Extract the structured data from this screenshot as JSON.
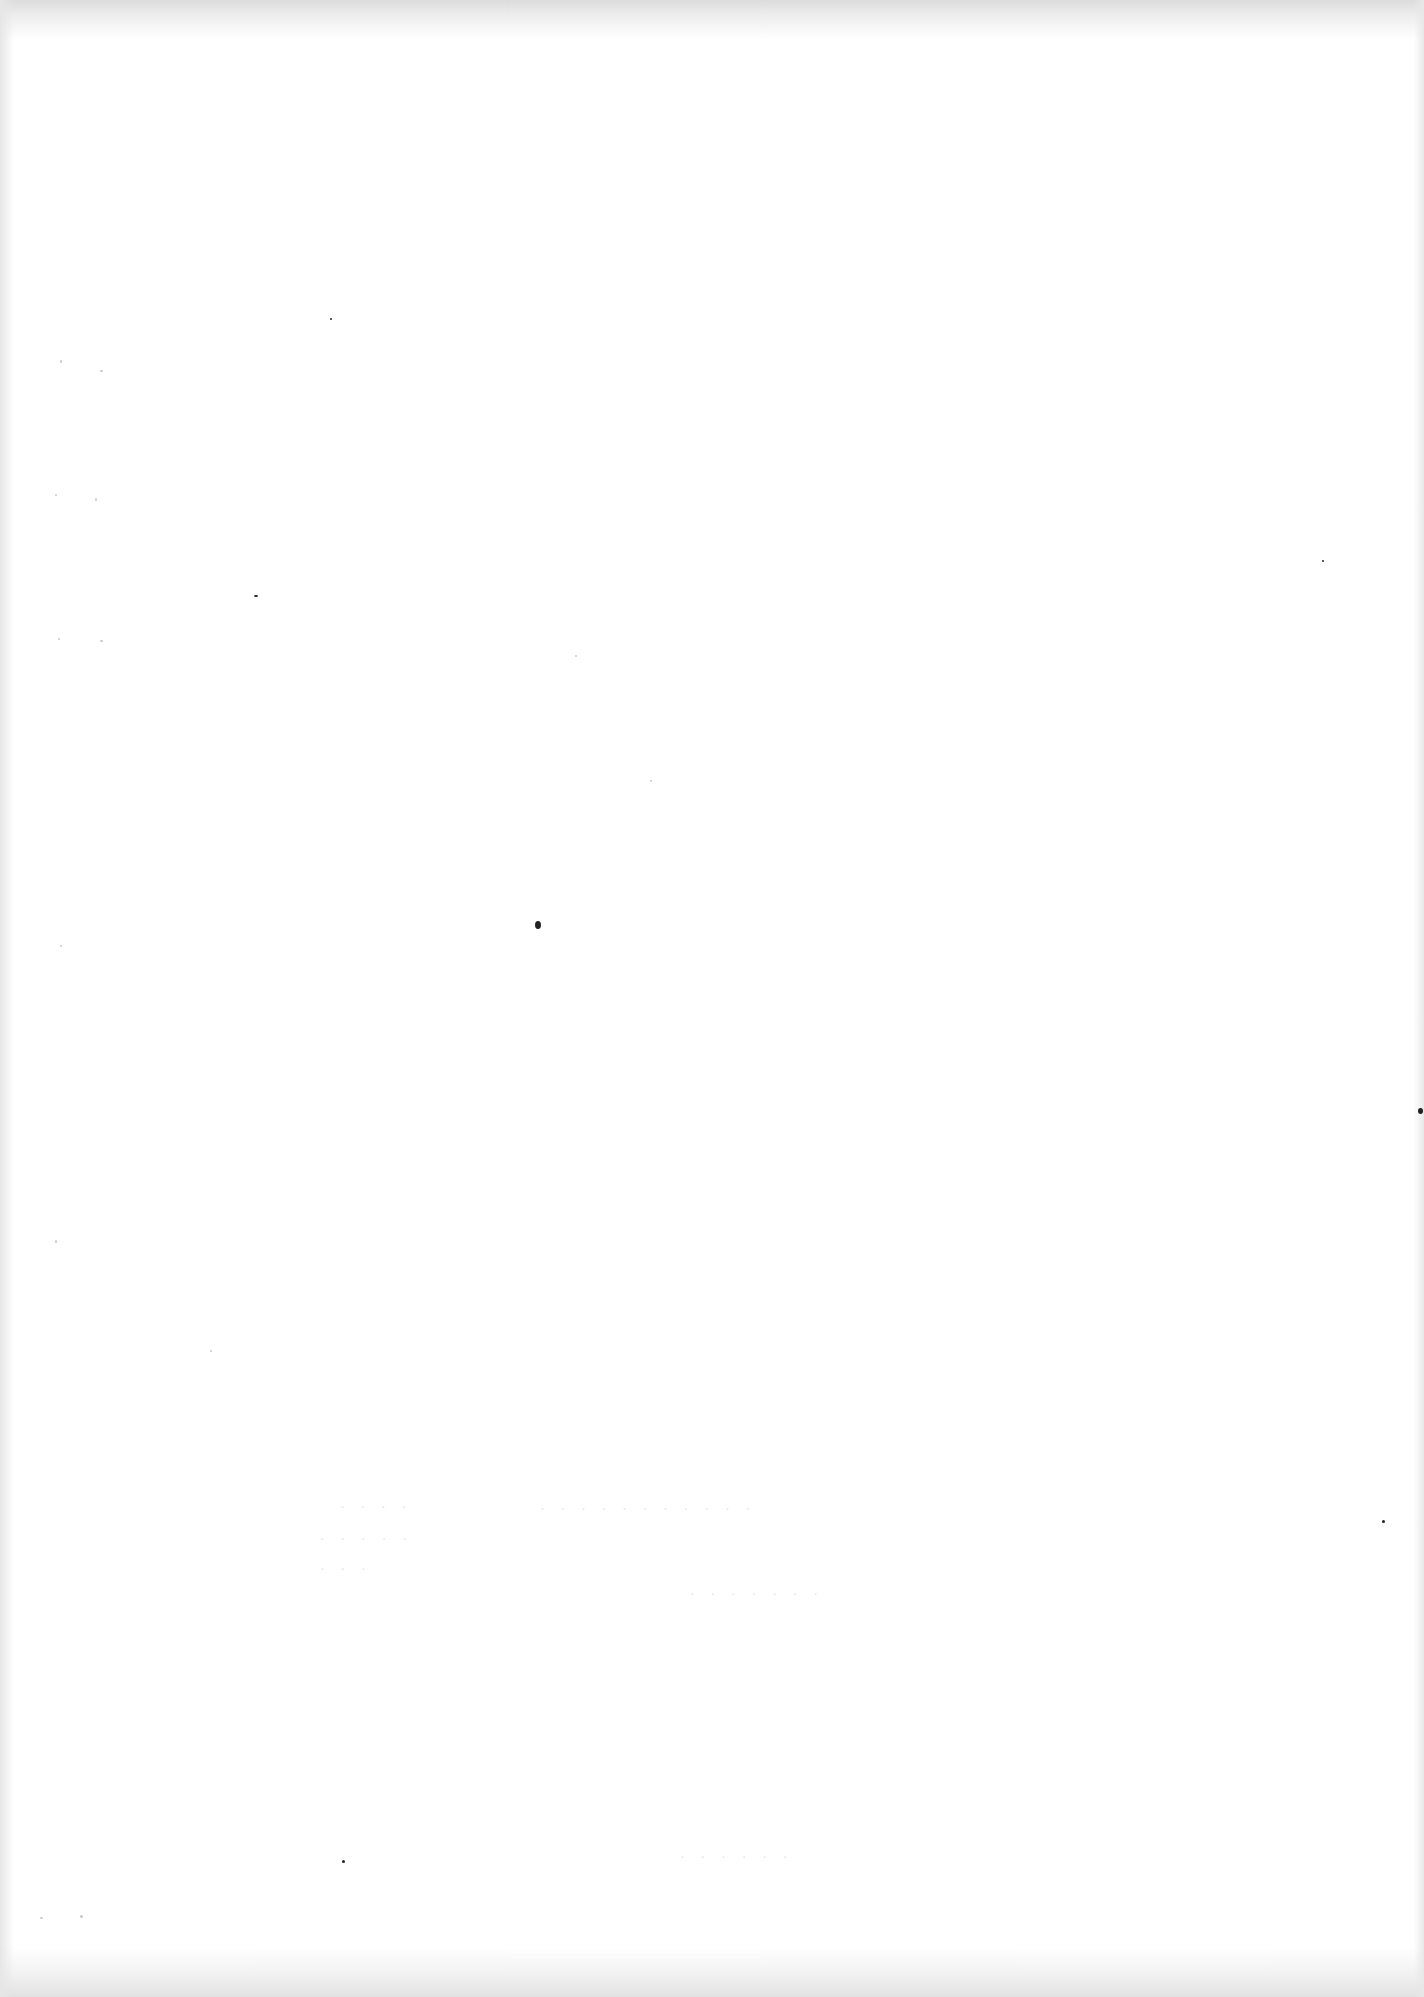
{
  "document": {
    "type": "scanned-page",
    "content": "",
    "background_color": "#ffffff",
    "speck_color": "#222222"
  }
}
